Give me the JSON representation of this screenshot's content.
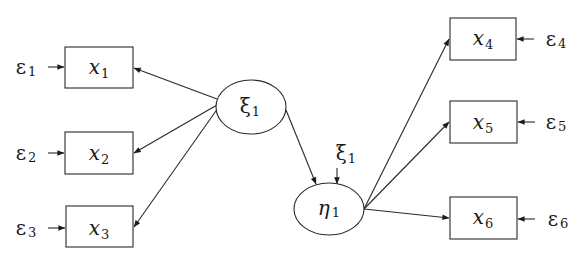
{
  "diagram": {
    "type": "structural-equation-model",
    "colors": {
      "stroke": "#2a2a2a",
      "text": "#1a1a1a",
      "background": "#ffffff"
    },
    "latent_nodes": [
      {
        "id": "xi1",
        "symbol": "ξ",
        "subscript": "1",
        "cx": 251,
        "cy": 107,
        "rx": 35,
        "ry": 27
      },
      {
        "id": "eta1",
        "symbol": "η",
        "subscript": "1",
        "cx": 329,
        "cy": 209,
        "rx": 35,
        "ry": 26
      }
    ],
    "observed_nodes": [
      {
        "id": "x1",
        "symbol": "x",
        "subscript": "1",
        "x": 65,
        "y": 47,
        "w": 68,
        "h": 41
      },
      {
        "id": "x2",
        "symbol": "x",
        "subscript": "2",
        "x": 65,
        "y": 132,
        "w": 68,
        "h": 42
      },
      {
        "id": "x3",
        "symbol": "x",
        "subscript": "3",
        "x": 66,
        "y": 206,
        "w": 67,
        "h": 41
      },
      {
        "id": "x4",
        "symbol": "x",
        "subscript": "4",
        "x": 450,
        "y": 18,
        "w": 66,
        "h": 42
      },
      {
        "id": "x5",
        "symbol": "x",
        "subscript": "5",
        "x": 450,
        "y": 101,
        "w": 67,
        "h": 42
      },
      {
        "id": "x6",
        "symbol": "x",
        "subscript": "6",
        "x": 450,
        "y": 197,
        "w": 67,
        "h": 42
      }
    ],
    "error_terms": [
      {
        "id": "e1",
        "symbol": "ε",
        "subscript": "1",
        "target": "x1"
      },
      {
        "id": "e2",
        "symbol": "ε",
        "subscript": "2",
        "target": "x2"
      },
      {
        "id": "e3",
        "symbol": "ε",
        "subscript": "3",
        "target": "x3"
      },
      {
        "id": "e4",
        "symbol": "ε",
        "subscript": "4",
        "target": "x4"
      },
      {
        "id": "e5",
        "symbol": "ε",
        "subscript": "5",
        "target": "x5"
      },
      {
        "id": "e6",
        "symbol": "ε",
        "subscript": "6",
        "target": "x6"
      }
    ],
    "disturbance": {
      "id": "zeta1",
      "symbol": "ξ",
      "subscript": "1",
      "target": "eta1"
    },
    "edges": [
      {
        "from": "xi1",
        "to": "x1"
      },
      {
        "from": "xi1",
        "to": "x2"
      },
      {
        "from": "xi1",
        "to": "x3"
      },
      {
        "from": "xi1",
        "to": "eta1"
      },
      {
        "from": "eta1",
        "to": "x4"
      },
      {
        "from": "eta1",
        "to": "x5"
      },
      {
        "from": "eta1",
        "to": "x6"
      }
    ]
  },
  "labels": {
    "xi1": {
      "main": "ξ",
      "sub": "1"
    },
    "eta1": {
      "main": "η",
      "sub": "1"
    },
    "x1": {
      "main": "x",
      "sub": "1"
    },
    "x2": {
      "main": "x",
      "sub": "2"
    },
    "x3": {
      "main": "x",
      "sub": "3"
    },
    "x4": {
      "main": "x",
      "sub": "4"
    },
    "x5": {
      "main": "x",
      "sub": "5"
    },
    "x6": {
      "main": "x",
      "sub": "6"
    },
    "e1": {
      "main": "ε",
      "sub": "1"
    },
    "e2": {
      "main": "ε",
      "sub": "2"
    },
    "e3": {
      "main": "ε",
      "sub": "3"
    },
    "e4": {
      "main": "ε",
      "sub": "4"
    },
    "e5": {
      "main": "ε",
      "sub": "5"
    },
    "e6": {
      "main": "ε",
      "sub": "6"
    },
    "dist": {
      "main": "ξ",
      "sub": "1"
    }
  }
}
